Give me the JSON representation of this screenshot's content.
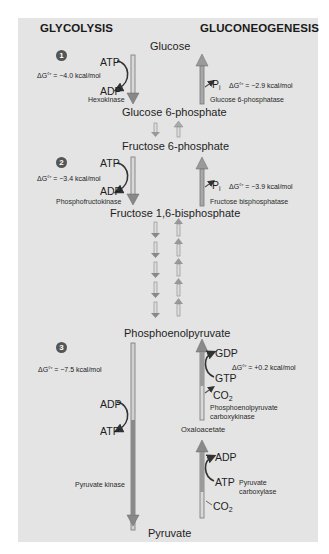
{
  "headers": {
    "left": "GLYCOLYSIS",
    "right": "GLUCONEOGENESIS"
  },
  "metabolites": {
    "glucose": "Glucose",
    "g6p": "Glucose 6-phosphate",
    "f6p": "Fructose 6-phosphate",
    "f16bp": "Fructose 1,6-bisphosphate",
    "pep": "Phosphoenolpyruvate",
    "oaa": "Oxaloacetate",
    "pyruvate": "Pyruvate"
  },
  "steps": [
    {
      "number": "1",
      "glycolysis": {
        "enzyme": "Hexokinase",
        "delta_g": "ΔG°′ = −4.0 kcal/mol",
        "cofactor_in": "ATP",
        "cofactor_out": "ADP"
      },
      "gluconeogenesis": {
        "enzyme": "Glucose 6-phosphatase",
        "delta_g": "ΔG°′ = −2.9 kcal/mol",
        "product": "P",
        "product_sub": "i"
      }
    },
    {
      "number": "2",
      "glycolysis": {
        "enzyme": "Phosphofructokinase",
        "delta_g": "ΔG°′ = −3.4 kcal/mol",
        "cofactor_in": "ATP",
        "cofactor_out": "ADP"
      },
      "gluconeogenesis": {
        "enzyme": "Fructose bisphosphatase",
        "delta_g": "ΔG°′ = −3.9 kcal/mol",
        "product": "P",
        "product_sub": "i"
      }
    },
    {
      "number": "3",
      "glycolysis": {
        "enzyme": "Pyruvate kinase",
        "delta_g": "ΔG°′ = −7.5 kcal/mol",
        "cofactor_in": "ADP",
        "cofactor_out": "ATP"
      },
      "gluconeogenesis": {
        "pepck": {
          "enzyme_line1": "Phosphoenolpyruvate",
          "enzyme_line2": "carboxykinase",
          "delta_g": "ΔG°′ = +0.2 kcal/mol",
          "cofactor_in": "GTP",
          "cofactor_out": "GDP",
          "released": "CO",
          "released_sub": "2"
        },
        "pc": {
          "enzyme_line1": "Pyruvate",
          "enzyme_line2": "carboxylase",
          "cofactor_in": "ATP",
          "cofactor_out": "ADP",
          "consumed": "CO",
          "consumed_sub": "2"
        }
      }
    }
  ],
  "colors": {
    "panel": "#e4e4e4",
    "arrow_down_fill": "#8a8a8a",
    "arrow_up_fill": "#9a9a9a",
    "arrow_outline": "#6f6f6f",
    "step_badge": "#555555"
  }
}
